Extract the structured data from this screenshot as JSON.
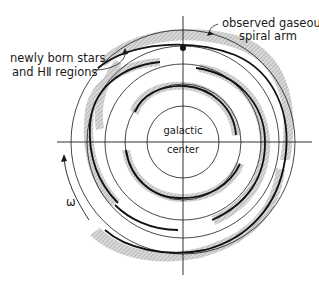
{
  "diagram": {
    "labels": {
      "newborn_line1": "newly born stars",
      "newborn_line2": "and HⅡ regions",
      "gas_line1": "observed gaseous",
      "gas_line2": "spiral arm",
      "center_line1": "galactic",
      "center_line2": "center",
      "rotation": "ω"
    },
    "colors": {
      "ink": "#1a1a1a",
      "shade": "#c8c8c8",
      "background": "#ffffff"
    },
    "geometry": {
      "center": [
        183,
        142
      ],
      "circle_radii": [
        36,
        58,
        78,
        96,
        112
      ],
      "axis_horizontal": [
        57,
        312
      ],
      "axis_vertical": [
        16,
        275
      ],
      "dot": [
        183,
        48
      ]
    }
  }
}
